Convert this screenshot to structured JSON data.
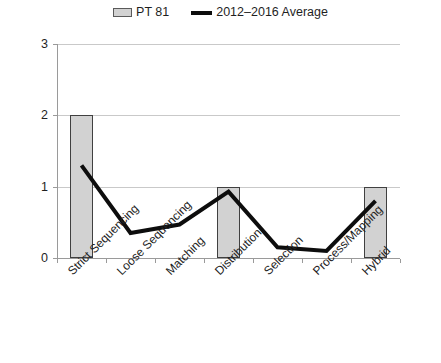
{
  "chart_data": {
    "type": "bar",
    "title": "",
    "subtitle": "",
    "xlabel": "",
    "ylabel": "",
    "ylim": [
      0,
      3
    ],
    "yticks": [
      0,
      1,
      2,
      3
    ],
    "ytick_labels": [
      "0",
      "1",
      "2",
      "3"
    ],
    "grid": true,
    "legend_position": "top-center",
    "categories": [
      "Strict Sequencing",
      "Loose Sequencing",
      "Matching",
      "Distribution",
      "Selection",
      "Process/Mapping",
      "Hybrid"
    ],
    "series": [
      {
        "name": "PT 81",
        "type": "bar",
        "color": "#d2d2d2",
        "edge_color": "#404040",
        "values": [
          2,
          0,
          0,
          1,
          0,
          0,
          1
        ]
      },
      {
        "name": "2012–2016 Average",
        "type": "line",
        "color": "#0d0d0d",
        "values": [
          1.3,
          0.35,
          0.47,
          0.93,
          0.15,
          0.1,
          0.8
        ]
      }
    ]
  },
  "legend": {
    "entries": [
      {
        "label": "PT 81",
        "swatch": "bar-swatch",
        "color": "#d2d2d2"
      },
      {
        "label": "2012–2016 Average",
        "swatch": "line-swatch",
        "color": "#0d0d0d"
      }
    ]
  },
  "axes": {
    "y": {
      "labels": [
        "3",
        "2",
        "1",
        "0"
      ]
    },
    "x": {
      "labels": [
        "Strict Sequencing",
        "Loose Sequencing",
        "Matching",
        "Distribution",
        "Selection",
        "Process/Mapping",
        "Hybrid"
      ]
    }
  }
}
